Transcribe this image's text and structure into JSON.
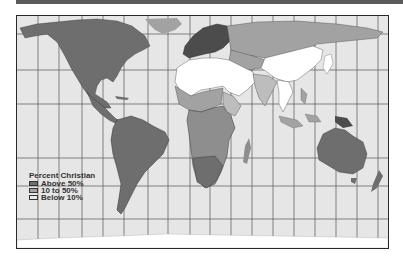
{
  "map": {
    "title": "Percent Christian world map",
    "projection": "Mercator",
    "colors": {
      "ocean": "#e6e6e6",
      "above_50": "#6e6e6e",
      "between_10_50": "#a2a2a2",
      "below_10": "#ffffff",
      "europe_dark": "#4c4c4c",
      "gridline": "#555555",
      "frame": "#2a2a2a"
    },
    "gridlines": {
      "vertical_x": [
        21,
        42,
        65,
        86,
        107,
        131,
        151,
        173,
        193,
        214,
        235,
        256,
        277,
        298,
        319,
        340,
        361
      ],
      "horizontal_y": [
        33,
        69,
        103,
        157,
        185,
        218
      ]
    }
  },
  "legend": {
    "title": "Percent Christian",
    "items": [
      {
        "label": "Above 50%",
        "color": "#6e6e6e"
      },
      {
        "label": "10 to 50%",
        "color": "#a2a2a2"
      },
      {
        "label": "Below 10%",
        "color": "#e8e8e8"
      }
    ]
  }
}
